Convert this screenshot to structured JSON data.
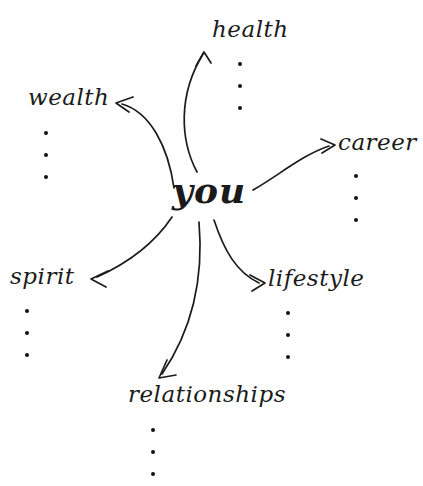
{
  "diagram": {
    "type": "mind-map",
    "title_text": "you",
    "style": "hand-lettered script, black ink on white",
    "center": {
      "label": "you",
      "x": 172,
      "y": 172
    },
    "branches": [
      {
        "id": "health",
        "label": "health",
        "x": 212,
        "y": 18,
        "arrow_direction": "up",
        "dots": {
          "count": 3,
          "x": 238,
          "y": 62
        }
      },
      {
        "id": "wealth",
        "label": "wealth",
        "x": 28,
        "y": 86,
        "arrow_direction": "up-left",
        "dots": {
          "count": 3,
          "x": 44,
          "y": 131
        }
      },
      {
        "id": "career",
        "label": "career",
        "x": 338,
        "y": 131,
        "arrow_direction": "up-right",
        "dots": {
          "count": 3,
          "x": 354,
          "y": 174
        }
      },
      {
        "id": "spirit",
        "label": "spirit",
        "x": 10,
        "y": 265,
        "arrow_direction": "down-left",
        "dots": {
          "count": 3,
          "x": 25,
          "y": 309
        }
      },
      {
        "id": "lifestyle",
        "label": "lifestyle",
        "x": 268,
        "y": 267,
        "arrow_direction": "down-right",
        "dots": {
          "count": 3,
          "x": 286,
          "y": 311
        }
      },
      {
        "id": "relationships",
        "label": "relationships",
        "x": 128,
        "y": 383,
        "arrow_direction": "down",
        "dots": {
          "count": 3,
          "x": 151,
          "y": 428
        }
      }
    ],
    "colors": {
      "ink": "#1b1b1b",
      "dot": "#121212",
      "background": "#ffffff"
    }
  }
}
